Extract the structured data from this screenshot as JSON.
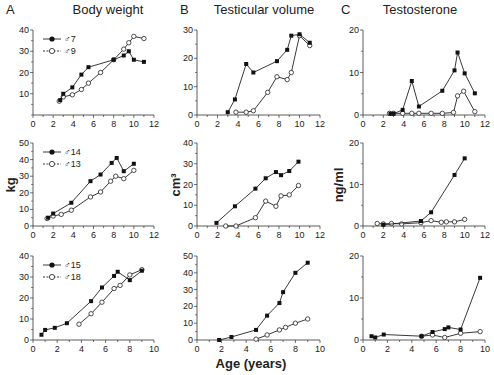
{
  "figure": {
    "xlabel": "Age (years)",
    "row_ylabels": [
      "",
      "kg",
      "cm³",
      "ng/ml"
    ]
  },
  "columns": [
    {
      "letter": "A",
      "title": "Body weight",
      "ylabel": "kg"
    },
    {
      "letter": "B",
      "title": "Testicular volume",
      "ylabel": "cm³"
    },
    {
      "letter": "C",
      "title": "Testosterone",
      "ylabel": "ng/ml"
    }
  ],
  "colors": {
    "line": "#222222",
    "filled_marker": "#111111",
    "open_marker_fill": "#ffffff"
  },
  "chart_data": [
    {
      "type": "line",
      "panel": "A-row1",
      "title": "Body weight",
      "ylabel": "",
      "xlim": [
        0,
        12
      ],
      "ylim": [
        0,
        40
      ],
      "xticks": [
        0,
        2,
        4,
        6,
        8,
        10,
        12
      ],
      "yticks": [
        10,
        20,
        30,
        40
      ],
      "legend": [
        "♂7",
        "♂9"
      ],
      "series": [
        {
          "name": "♂7",
          "marker": "filled",
          "x": [
            2.7,
            3.0,
            3.9,
            4.8,
            5.5,
            8.0,
            9.0,
            9.5,
            10.0,
            11.0
          ],
          "y": [
            7,
            10,
            13,
            19,
            22.5,
            26,
            28,
            30,
            26,
            25
          ]
        },
        {
          "name": "♂9",
          "marker": "open",
          "x": [
            2.6,
            3.0,
            3.9,
            4.8,
            5.5,
            6.7,
            8.0,
            9.0,
            9.5,
            10.0,
            11.0
          ],
          "y": [
            6.5,
            8.5,
            9.5,
            12,
            15,
            20,
            26,
            31,
            34,
            37,
            36
          ]
        }
      ]
    },
    {
      "type": "line",
      "panel": "B-row1",
      "title": "Testicular volume",
      "ylabel": "",
      "xlim": [
        0,
        12
      ],
      "ylim": [
        0,
        30
      ],
      "xticks": [
        0,
        2,
        4,
        6,
        8,
        10,
        12
      ],
      "yticks": [
        0,
        10,
        20,
        30
      ],
      "series": [
        {
          "name": "♂7",
          "marker": "filled",
          "x": [
            3.0,
            3.7,
            4.8,
            5.5,
            7.8,
            8.8,
            9.2,
            10.0,
            11.0
          ],
          "y": [
            1,
            5.5,
            18,
            15,
            19,
            23,
            28,
            28.5,
            25.5
          ]
        },
        {
          "name": "♂9",
          "marker": "open",
          "x": [
            3.8,
            4.8,
            5.5,
            6.9,
            7.8,
            8.8,
            9.2,
            10.0,
            11.0
          ],
          "y": [
            1,
            1,
            1.5,
            8,
            13.5,
            12.5,
            15,
            28,
            24.5
          ]
        }
      ]
    },
    {
      "type": "line",
      "panel": "C-row1",
      "title": "Testosterone",
      "ylabel": "",
      "xlim": [
        0,
        12
      ],
      "ylim": [
        0,
        20
      ],
      "xticks": [
        0,
        2,
        4,
        6,
        8,
        10,
        12
      ],
      "yticks": [
        0,
        10,
        20
      ],
      "series": [
        {
          "name": "♂7",
          "marker": "filled",
          "x": [
            2.7,
            3.0,
            3.9,
            4.8,
            5.5,
            7.8,
            9.0,
            9.3,
            10.0,
            11.0
          ],
          "y": [
            0.3,
            0.3,
            1.2,
            8,
            2,
            5.7,
            10.5,
            14.7,
            9.8,
            5.1
          ]
        },
        {
          "name": "♂9",
          "marker": "open",
          "x": [
            2.6,
            3.0,
            3.9,
            4.8,
            5.5,
            6.7,
            7.8,
            8.9,
            9.3,
            9.9,
            11.0
          ],
          "y": [
            0.4,
            0.4,
            0.4,
            0.4,
            0.4,
            0.4,
            0.4,
            0.6,
            4.5,
            5.6,
            0.8
          ]
        }
      ]
    },
    {
      "type": "line",
      "panel": "A-row2",
      "title": "",
      "ylabel": "kg",
      "xlim": [
        0,
        12
      ],
      "ylim": [
        0,
        50
      ],
      "xticks": [
        0,
        2,
        4,
        6,
        8,
        10,
        12
      ],
      "yticks": [
        0,
        10,
        20,
        30,
        40,
        50
      ],
      "legend": [
        "♂14",
        "♂13"
      ],
      "series": [
        {
          "name": "♂14",
          "marker": "filled",
          "x": [
            1.5,
            2.0,
            3.8,
            5.7,
            6.7,
            7.8,
            8.3,
            9.0,
            10.0
          ],
          "y": [
            5,
            7.5,
            14,
            27,
            31,
            38,
            41,
            33,
            37.5
          ]
        },
        {
          "name": "♂13",
          "marker": "open",
          "x": [
            1.4,
            2.0,
            2.8,
            3.8,
            5.7,
            6.7,
            7.7,
            8.2,
            9.0,
            10.0
          ],
          "y": [
            4.5,
            6,
            7,
            9.5,
            17.5,
            20.5,
            27,
            30,
            28.5,
            33.5
          ]
        }
      ]
    },
    {
      "type": "line",
      "panel": "B-row2",
      "title": "",
      "ylabel": "cm³",
      "xlim": [
        0,
        12
      ],
      "ylim": [
        0,
        40
      ],
      "xticks": [
        0,
        2,
        4,
        6,
        8,
        10,
        12
      ],
      "yticks": [
        0,
        10,
        20,
        30,
        40
      ],
      "series": [
        {
          "name": "♂14",
          "marker": "filled",
          "x": [
            1.9,
            3.7,
            5.7,
            6.7,
            7.7,
            8.2,
            9.0,
            9.9
          ],
          "y": [
            1.5,
            9.5,
            18,
            23,
            26,
            24.5,
            26.5,
            31
          ]
        },
        {
          "name": "♂13",
          "marker": "open",
          "x": [
            2.8,
            3.8,
            5.7,
            6.7,
            7.7,
            8.2,
            9.0,
            9.9
          ],
          "y": [
            0,
            0,
            4,
            12,
            9.5,
            14.5,
            15,
            19.5
          ]
        }
      ]
    },
    {
      "type": "line",
      "panel": "C-row2",
      "title": "",
      "ylabel": "ng/ml",
      "xlim": [
        0,
        12
      ],
      "ylim": [
        0,
        20
      ],
      "xticks": [
        0,
        2,
        4,
        6,
        8,
        10,
        12
      ],
      "yticks": [
        0,
        10,
        20
      ],
      "series": [
        {
          "name": "♂14",
          "marker": "filled",
          "x": [
            2.0,
            5.7,
            6.7,
            9.0,
            10.0
          ],
          "y": [
            0.3,
            1.2,
            3.3,
            12.3,
            16.3
          ]
        },
        {
          "name": "♂13",
          "marker": "open",
          "x": [
            1.4,
            2.0,
            2.8,
            3.8,
            5.7,
            6.7,
            7.7,
            8.2,
            9.0,
            10.0
          ],
          "y": [
            0.6,
            0.5,
            0.6,
            0.5,
            0.8,
            1.3,
            0.9,
            1.0,
            1.0,
            1.6
          ]
        }
      ]
    },
    {
      "type": "line",
      "panel": "A-row3",
      "title": "",
      "ylabel": "",
      "xlim": [
        0,
        10
      ],
      "ylim": [
        0,
        40
      ],
      "xticks": [
        0,
        2,
        4,
        6,
        8,
        10
      ],
      "yticks": [
        0,
        10,
        20,
        30,
        40
      ],
      "legend": [
        "♂15",
        "♂18"
      ],
      "series": [
        {
          "name": "♂15",
          "marker": "filled",
          "x": [
            0.7,
            1.0,
            1.8,
            2.8,
            4.8,
            5.7,
            6.7,
            7.0,
            8.0,
            9.0
          ],
          "y": [
            2.5,
            4.8,
            5.8,
            8,
            18.5,
            25,
            30.5,
            32.5,
            28.5,
            33
          ]
        },
        {
          "name": "♂18",
          "marker": "open",
          "x": [
            3.8,
            4.8,
            5.7,
            6.7,
            7.2,
            8.0,
            9.0
          ],
          "y": [
            7.5,
            12.5,
            18,
            24.5,
            26,
            31,
            33.5
          ]
        }
      ]
    },
    {
      "type": "line",
      "panel": "B-row3",
      "title": "",
      "ylabel": "",
      "xlabel": "Age (years)",
      "xlim": [
        0,
        10
      ],
      "ylim": [
        0,
        50
      ],
      "xticks": [
        0,
        2,
        4,
        6,
        8,
        10
      ],
      "yticks": [
        0,
        10,
        20,
        30,
        40,
        50
      ],
      "series": [
        {
          "name": "♂15",
          "marker": "filled",
          "x": [
            1.8,
            2.8,
            4.8,
            5.7,
            6.7,
            7.0,
            8.0,
            9.0
          ],
          "y": [
            0,
            1.8,
            6,
            14.5,
            22,
            28.5,
            40,
            46
          ]
        },
        {
          "name": "♂18",
          "marker": "open",
          "x": [
            4.8,
            5.7,
            6.7,
            7.2,
            8.0,
            9.0
          ],
          "y": [
            0.5,
            3,
            6,
            7.5,
            10,
            12.5
          ]
        }
      ]
    },
    {
      "type": "line",
      "panel": "C-row3",
      "title": "",
      "ylabel": "",
      "xlim": [
        0,
        10
      ],
      "ylim": [
        0,
        20
      ],
      "xticks": [
        0,
        2,
        4,
        6,
        8,
        10
      ],
      "yticks": [
        0,
        10,
        20
      ],
      "series": [
        {
          "name": "♂15",
          "marker": "filled",
          "x": [
            0.7,
            1.0,
            1.7,
            4.8,
            5.7,
            6.7,
            7.0,
            8.0,
            9.6
          ],
          "y": [
            0.9,
            0.6,
            1.3,
            0.9,
            1.9,
            2.6,
            3.0,
            2.5,
            14.8
          ]
        },
        {
          "name": "♂18",
          "marker": "open",
          "x": [
            4.8,
            5.7,
            6.7,
            8.0,
            9.6
          ],
          "y": [
            0.9,
            1.2,
            0.6,
            1.6,
            2.0
          ]
        }
      ]
    }
  ]
}
